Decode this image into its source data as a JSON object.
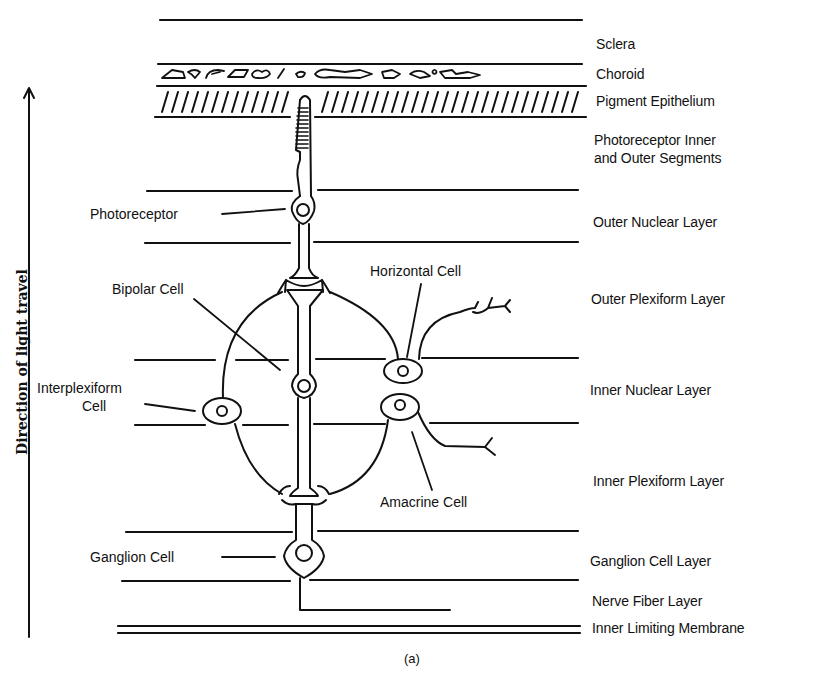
{
  "figure": {
    "caption": "(a)",
    "axis_label": "Direction of light travel",
    "axis_direction": "up",
    "line_color": "#111111",
    "background": "#ffffff"
  },
  "layers": [
    {
      "id": "sclera",
      "label": "Sclera",
      "y": 44
    },
    {
      "id": "choroid",
      "label": "Choroid",
      "y": 66
    },
    {
      "id": "pigment-epithelium",
      "label": "Pigment Epithelium",
      "y": 93
    },
    {
      "id": "photoreceptor-segments",
      "label": "Photoreceptor Inner",
      "label2": "and Outer Segments",
      "y": 132
    },
    {
      "id": "outer-nuclear",
      "label": "Outer Nuclear Layer",
      "y": 214
    },
    {
      "id": "outer-plexiform",
      "label": "Outer Plexiform Layer",
      "y": 291
    },
    {
      "id": "inner-nuclear",
      "label": "Inner Nuclear Layer",
      "y": 382
    },
    {
      "id": "inner-plexiform",
      "label": "Inner Plexiform Layer",
      "y": 473
    },
    {
      "id": "ganglion-cell",
      "label": "Ganglion Cell Layer",
      "y": 553
    },
    {
      "id": "nerve-fiber",
      "label": "Nerve Fiber Layer",
      "y": 593
    },
    {
      "id": "inner-limiting-membrane",
      "label": "Inner Limiting Membrane",
      "y": 620
    }
  ],
  "cells": [
    {
      "id": "photoreceptor",
      "label": "Photoreceptor"
    },
    {
      "id": "bipolar",
      "label": "Bipolar Cell"
    },
    {
      "id": "horizontal",
      "label": "Horizontal Cell"
    },
    {
      "id": "interplexiform",
      "label": "Interplexiform",
      "label2": "Cell"
    },
    {
      "id": "amacrine",
      "label": "Amacrine Cell"
    },
    {
      "id": "ganglion",
      "label": "Ganglion Cell"
    }
  ]
}
